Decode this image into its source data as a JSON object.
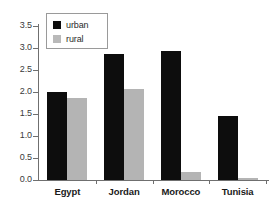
{
  "chart_data": {
    "type": "bar",
    "title": "",
    "xlabel": "",
    "ylabel": "",
    "categories": [
      "Egypt",
      "Jordan",
      "Morocco",
      "Tunisia"
    ],
    "series": [
      {
        "name": "urban",
        "color": "#0d0d0d",
        "values": [
          2.0,
          2.87,
          2.93,
          1.45
        ]
      },
      {
        "name": "rural",
        "color": "#b4b4b4",
        "values": [
          1.87,
          2.07,
          0.18,
          0.05
        ]
      }
    ],
    "ylim": [
      0.0,
      3.5
    ],
    "ytick_labels": [
      "0.0",
      "0.5",
      "1.0",
      "1.5",
      "2.0",
      "2.5",
      "3.0",
      "3.5"
    ],
    "ytick_values": [
      0.0,
      0.5,
      1.0,
      1.5,
      2.0,
      2.5,
      3.0,
      3.5
    ],
    "grid": false,
    "legend_position": "upper-left",
    "legend_entries": [
      "urban",
      "rural"
    ]
  }
}
